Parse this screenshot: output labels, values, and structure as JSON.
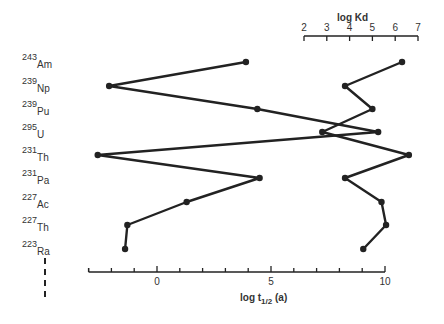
{
  "chart_data": {
    "type": "line",
    "title": "",
    "categories": [
      "243Am",
      "239Np",
      "239Pu",
      "295U",
      "231Th",
      "231Pa",
      "227Ac",
      "227Th",
      "223Ra"
    ],
    "category_labels": [
      {
        "mass": "243",
        "element": "Am"
      },
      {
        "mass": "239",
        "element": "Np"
      },
      {
        "mass": "239",
        "element": "Pu"
      },
      {
        "mass": "295",
        "element": "U"
      },
      {
        "mass": "231",
        "element": "Th"
      },
      {
        "mass": "231",
        "element": "Pa"
      },
      {
        "mass": "227",
        "element": "Ac"
      },
      {
        "mass": "227",
        "element": "Th"
      },
      {
        "mass": "223",
        "element": "Ra"
      }
    ],
    "series": [
      {
        "name": "log t1/2 (a)",
        "axis": "bottom",
        "values": [
          3.9,
          -2.1,
          4.4,
          9.7,
          -2.6,
          4.5,
          1.3,
          -1.3,
          -1.4
        ]
      },
      {
        "name": "log Kd",
        "axis": "top",
        "values": [
          6.3,
          3.8,
          5.0,
          2.8,
          6.6,
          3.8,
          5.4,
          5.6,
          4.6
        ]
      }
    ],
    "bottom_axis": {
      "label": "log t",
      "label_sub": "1/2",
      "label_suffix": " (a)",
      "range": [
        -3,
        10
      ],
      "tick_labels": [
        "0",
        "5",
        "10"
      ],
      "tick_values": [
        0,
        5,
        10
      ]
    },
    "top_axis": {
      "label": "log Kd",
      "range": [
        2,
        7
      ],
      "tick_labels": [
        "2",
        "3",
        "4",
        "5",
        "6",
        "7"
      ],
      "tick_values": [
        2,
        3,
        4,
        5,
        6,
        7
      ]
    },
    "grid": false,
    "legend": "none"
  }
}
